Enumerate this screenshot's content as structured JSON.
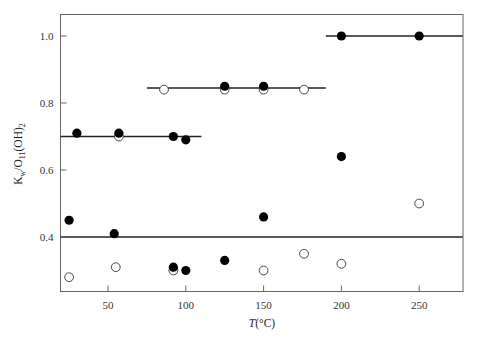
{
  "chart_data": {
    "type": "scatter",
    "title": "",
    "xlabel": "T(°C)",
    "xlabel_italic_part": "T",
    "xlabel_rest": "(°C)",
    "ylabel": "K_w/O_11(OH)_2",
    "xlim": [
      19,
      278
    ],
    "ylim": [
      0.235,
      1.065
    ],
    "x_ticks": [
      50,
      100,
      150,
      200,
      250
    ],
    "x_tick_labels": [
      "50",
      "100",
      "150",
      "200",
      "250"
    ],
    "y_ticks": [
      0.4,
      0.6,
      0.8,
      1.0
    ],
    "y_tick_labels": [
      "0.4",
      "0.6",
      "0.8",
      "1.0"
    ],
    "grid": false,
    "legend": null,
    "series": [
      {
        "name": "filled circles",
        "marker": "filled-circle",
        "points": [
          [
            25,
            0.45
          ],
          [
            30,
            0.71
          ],
          [
            54,
            0.41
          ],
          [
            57,
            0.71
          ],
          [
            92,
            0.7
          ],
          [
            100,
            0.69
          ],
          [
            92,
            0.31
          ],
          [
            100,
            0.3
          ],
          [
            125,
            0.85
          ],
          [
            125,
            0.33
          ],
          [
            150,
            0.85
          ],
          [
            150,
            0.46
          ],
          [
            200,
            1.0
          ],
          [
            200,
            0.64
          ],
          [
            250,
            1.0
          ]
        ]
      },
      {
        "name": "open circles",
        "marker": "open-circle",
        "points": [
          [
            25,
            0.28
          ],
          [
            55,
            0.31
          ],
          [
            57,
            0.7
          ],
          [
            86,
            0.84
          ],
          [
            92,
            0.3
          ],
          [
            125,
            0.84
          ],
          [
            150,
            0.84
          ],
          [
            150,
            0.3
          ],
          [
            176,
            0.35
          ],
          [
            176,
            0.84
          ],
          [
            200,
            0.32
          ],
          [
            250,
            0.5
          ]
        ]
      }
    ],
    "reference_lines": [
      {
        "y": 0.7,
        "x_from": 19,
        "x_to": 110
      },
      {
        "y": 0.845,
        "x_from": 75,
        "x_to": 190
      },
      {
        "y": 1.0,
        "x_from": 190,
        "x_to": 278
      },
      {
        "y": 0.4,
        "x_from": 19,
        "x_to": 278
      }
    ]
  },
  "labels": {
    "ylabel_main": "K",
    "ylabel_sub1": "w",
    "ylabel_mid": "/O",
    "ylabel_sub2": "11",
    "ylabel_end": "(OH)",
    "ylabel_sub3": "2",
    "xlabel_italic": "T",
    "xlabel_rest": "(°C)"
  },
  "colors": {
    "axis": "#555555",
    "marker": "#000000",
    "line": "#222222",
    "background": "#ffffff"
  }
}
